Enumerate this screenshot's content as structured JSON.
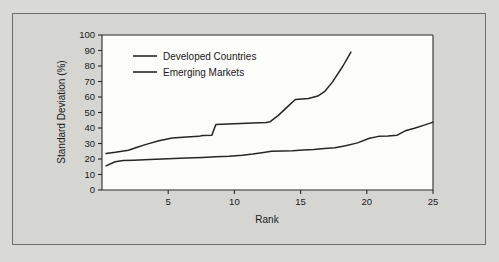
{
  "figure": {
    "background_color": "#d9d9d6",
    "panel_color": "#d5d5d2",
    "plot_background": "#fcfcfa",
    "line_color": "#262626",
    "border_color": "#6e6e6e"
  },
  "chart_data": {
    "type": "line",
    "title": "",
    "subtitle": "",
    "xlabel": "Rank",
    "ylabel": "Standard Deviation (%)",
    "xlim": [
      0,
      25
    ],
    "ylim": [
      0,
      100
    ],
    "xticks": [
      5,
      10,
      15,
      20,
      25
    ],
    "xtick_labels": [
      "5",
      "10",
      "15",
      "20",
      "25"
    ],
    "yticks": [
      0,
      10,
      20,
      30,
      40,
      50,
      60,
      70,
      80,
      90,
      100
    ],
    "ytick_labels": [
      "0",
      "10",
      "20",
      "30",
      "40",
      "50",
      "60",
      "70",
      "80",
      "90",
      "100"
    ],
    "grid": false,
    "legend_position": "upper-left",
    "series": [
      {
        "name": "Emerging Markets",
        "color": "#262626",
        "x": [
          0.3,
          1.0,
          2.0,
          2.6,
          3.4,
          4.3,
          5.3,
          6.4,
          7.3,
          7.6,
          8.3,
          8.6,
          10.0,
          11.4,
          12.4,
          12.7,
          13.3,
          14.0,
          14.6,
          15.6,
          16.3,
          16.8,
          17.4,
          18.2,
          18.8
        ],
        "y": [
          23.6,
          24.3,
          25.6,
          27.4,
          29.6,
          31.8,
          33.6,
          34.2,
          34.6,
          35.2,
          35.4,
          42.2,
          42.8,
          43.2,
          43.6,
          44.1,
          48.0,
          53.6,
          58.4,
          59.0,
          60.6,
          63.4,
          69.6,
          80.0,
          89.0
        ]
      },
      {
        "name": "Developed Countries",
        "color": "#262626",
        "x": [
          0.3,
          1.0,
          1.6,
          2.4,
          3.6,
          5.0,
          6.4,
          7.6,
          8.6,
          9.6,
          10.6,
          11.4,
          12.2,
          12.8,
          13.6,
          14.4,
          15.2,
          16.0,
          16.8,
          17.6,
          18.4,
          19.3,
          20.2,
          20.9,
          21.6,
          22.3,
          22.9,
          23.6,
          24.4,
          25.0
        ],
        "y": [
          15.6,
          18.2,
          19.0,
          19.2,
          19.6,
          20.2,
          20.6,
          21.0,
          21.4,
          21.8,
          22.4,
          23.2,
          24.2,
          25.0,
          25.2,
          25.4,
          25.8,
          26.2,
          26.8,
          27.2,
          28.6,
          30.4,
          33.4,
          34.6,
          34.8,
          35.4,
          38.2,
          39.8,
          42.0,
          43.8
        ]
      }
    ],
    "legend": [
      {
        "label": "Developed Countries"
      },
      {
        "label": "Emerging Markets"
      }
    ]
  }
}
